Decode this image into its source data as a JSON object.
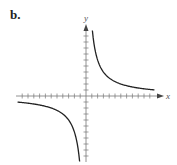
{
  "figure": {
    "label": "b.",
    "x_axis_label": "x",
    "y_axis_label": "y"
  },
  "chart_data": {
    "type": "line",
    "title": "",
    "function": "y = k/x (hyperbola)",
    "k": 12,
    "xlabel": "x",
    "ylabel": "y",
    "xlim": [
      -12,
      12
    ],
    "ylim": [
      -11,
      11
    ],
    "tick_spacing": 1,
    "grid": false,
    "series": [
      {
        "name": "branch-quadrant-I",
        "x": [
          1.2,
          1.5,
          2,
          3,
          4,
          6,
          8,
          11.5
        ],
        "y": [
          10,
          8,
          6,
          4,
          3,
          2,
          1.5,
          1.04
        ]
      },
      {
        "name": "branch-quadrant-III",
        "x": [
          -11.5,
          -8,
          -6,
          -4,
          -3,
          -2,
          -1.5,
          -1.2
        ],
        "y": [
          -1.04,
          -1.5,
          -2,
          -3,
          -4,
          -6,
          -8,
          -10
        ]
      }
    ],
    "colors": {
      "curve": "#222222",
      "axes": "#666666"
    }
  }
}
